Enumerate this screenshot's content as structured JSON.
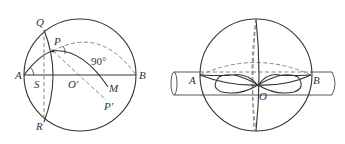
{
  "figures": [
    {
      "id": "sphere-section",
      "labels": {
        "Q": "Q",
        "P": "P",
        "A": "A",
        "S": "S",
        "O_prime": "O'",
        "M": "M",
        "B": "B",
        "P_prime": "P'",
        "R": "R",
        "angle": "90°"
      }
    },
    {
      "id": "sphere-with-cylinder",
      "labels": {
        "A": "A",
        "B": "B",
        "O": "O"
      }
    }
  ]
}
